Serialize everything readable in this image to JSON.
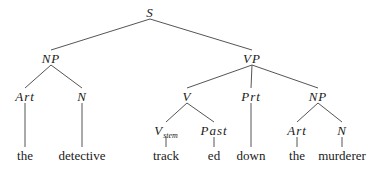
{
  "diagram": {
    "type": "syntax-tree",
    "nodes": {
      "S": {
        "label": "S",
        "x": 150,
        "y": 12
      },
      "NP1": {
        "label": "NP",
        "x": 51,
        "y": 58
      },
      "VP": {
        "label": "VP",
        "x": 252,
        "y": 58
      },
      "Art1": {
        "label": "Art",
        "x": 25,
        "y": 96
      },
      "N1": {
        "label": "N",
        "x": 82,
        "y": 96
      },
      "V": {
        "label": "V",
        "x": 187,
        "y": 96
      },
      "Prt": {
        "label": "Prt",
        "x": 251,
        "y": 96
      },
      "NP2": {
        "label": "NP",
        "x": 318,
        "y": 96
      },
      "Vstem": {
        "label": "V",
        "sub": "stem",
        "x": 166,
        "y": 130
      },
      "Past": {
        "label": "Past",
        "x": 214,
        "y": 130
      },
      "Art2": {
        "label": "Art",
        "x": 297,
        "y": 130
      },
      "N2": {
        "label": "N",
        "x": 342,
        "y": 130
      }
    },
    "words": [
      {
        "text": "the",
        "x": 25,
        "y": 155
      },
      {
        "text": "detective",
        "x": 82,
        "y": 155
      },
      {
        "text": "track",
        "x": 166,
        "y": 155
      },
      {
        "text": "ed",
        "x": 214,
        "y": 155
      },
      {
        "text": "down",
        "x": 251,
        "y": 155
      },
      {
        "text": "the",
        "x": 297,
        "y": 155
      },
      {
        "text": "murderer",
        "x": 342,
        "y": 155
      }
    ],
    "edges": [
      [
        "S",
        "NP1"
      ],
      [
        "S",
        "VP"
      ],
      [
        "NP1",
        "Art1"
      ],
      [
        "NP1",
        "N1"
      ],
      [
        "VP",
        "V"
      ],
      [
        "VP",
        "Prt"
      ],
      [
        "VP",
        "NP2"
      ],
      [
        "V",
        "Vstem"
      ],
      [
        "V",
        "Past"
      ],
      [
        "NP2",
        "Art2"
      ],
      [
        "NP2",
        "N2"
      ],
      [
        "Art1",
        "w0"
      ],
      [
        "N1",
        "w1"
      ],
      [
        "Vstem",
        "w2"
      ],
      [
        "Past",
        "w3"
      ],
      [
        "Prt",
        "w4"
      ],
      [
        "Art2",
        "w5"
      ],
      [
        "N2",
        "w6"
      ]
    ],
    "line_color": "#555555"
  }
}
